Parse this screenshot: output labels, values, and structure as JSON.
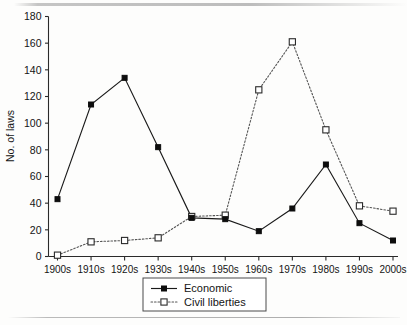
{
  "chart_data": {
    "type": "line",
    "title": "",
    "xlabel": "",
    "ylabel": "No. of laws",
    "categories": [
      "1900s",
      "1910s",
      "1920s",
      "1930s",
      "1940s",
      "1950s",
      "1960s",
      "1970s",
      "1980s",
      "1990s",
      "2000s"
    ],
    "ylim": [
      0,
      180
    ],
    "yticks": [
      0,
      20,
      40,
      60,
      80,
      100,
      120,
      140,
      160,
      180
    ],
    "ytick_labels": [
      "0",
      "20",
      "40",
      "60",
      "80",
      "100",
      "120",
      "140",
      "160",
      "180"
    ],
    "grid": false,
    "legend_position": "bottom-center",
    "series": [
      {
        "name": "Economic",
        "marker": "filled-square",
        "linestyle": "solid",
        "color": "#0d0d0d",
        "values": [
          43,
          114,
          134,
          82,
          29,
          28,
          19,
          36,
          69,
          25,
          12
        ]
      },
      {
        "name": "Civil liberties",
        "marker": "open-square",
        "linestyle": "dotted",
        "color": "#555555",
        "values": [
          1,
          11,
          12,
          14,
          30,
          31,
          125,
          161,
          95,
          38,
          34
        ]
      }
    ]
  },
  "legend": {
    "entries": [
      {
        "label": "Economic"
      },
      {
        "label": "Civil liberties"
      }
    ]
  },
  "axes": {
    "y_axis_title": "No. of laws"
  }
}
